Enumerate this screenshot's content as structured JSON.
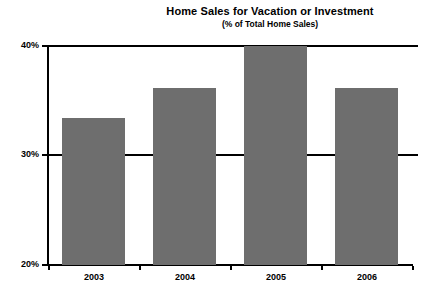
{
  "chart_data": {
    "type": "bar",
    "title": "Home Sales for Vacation or Investment",
    "subtitle": "(% of Total Home Sales)",
    "xlabel": "",
    "ylabel": "",
    "categories": [
      "2003",
      "2004",
      "2005",
      "2006"
    ],
    "values": [
      33.4,
      36.2,
      40.0,
      36.2
    ],
    "value_labels": [
      "33.4%",
      "36.2%",
      "40.0%",
      "36.2%"
    ],
    "ylim": [
      20,
      40
    ],
    "ytick_labels": [
      "20%",
      "30%",
      "40%"
    ],
    "ytick_values": [
      20,
      30,
      40
    ],
    "grid": true,
    "grid_orientation": "horizontal",
    "legend": "none",
    "series": [
      {
        "name": "Home Sales for Vacation or Investment",
        "values": [
          33.4,
          36.2,
          40.0,
          36.2
        ]
      }
    ],
    "colors": {
      "bar_fill": "#6e6e6e",
      "axis": "#000000",
      "background": "#ffffff",
      "text": "#000000"
    }
  },
  "axis": {
    "y_ticks": [
      {
        "label": "40%",
        "value": 40
      },
      {
        "label": "30%",
        "value": 30
      },
      {
        "label": "20%",
        "value": 20
      }
    ],
    "x_ticks": [
      {
        "label": "2003"
      },
      {
        "label": "2004"
      },
      {
        "label": "2005"
      },
      {
        "label": "2006"
      }
    ]
  }
}
